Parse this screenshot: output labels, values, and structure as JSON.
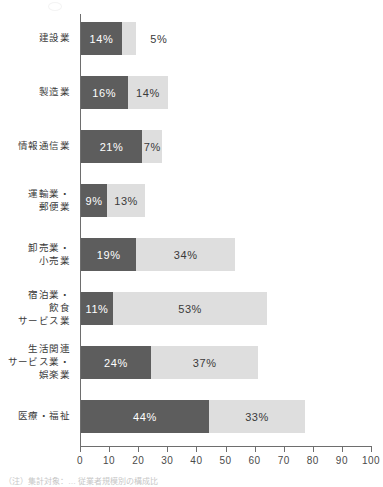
{
  "chart_data": {
    "type": "bar",
    "orientation": "horizontal",
    "stacked": true,
    "title": "",
    "subtitle": "",
    "xlabel": "",
    "ylabel": "",
    "xlim": [
      0,
      100
    ],
    "xticks": [
      "0",
      "10",
      "20",
      "30",
      "40",
      "50",
      "60",
      "70",
      "80",
      "90",
      "100"
    ],
    "grid": false,
    "legend_position": "none",
    "categories": [
      "建設業",
      "製造業",
      "情報通信業",
      "運輸業・\n郵便業",
      "卸売業・\n小売業",
      "宿泊業・\n飲食\nサービス業",
      "生活関連\nサービス業・\n娯楽業",
      "医療・福祉"
    ],
    "series": [
      {
        "name": "series-dark",
        "color": "#5d5d5d",
        "values": [
          14,
          16,
          21,
          9,
          19,
          11,
          24,
          44
        ],
        "labels": [
          "14%",
          "16%",
          "21%",
          "9%",
          "19%",
          "11%",
          "24%",
          "44%"
        ]
      },
      {
        "name": "series-light",
        "color": "#dedede",
        "values": [
          5,
          14,
          7,
          13,
          34,
          53,
          37,
          33
        ],
        "labels": [
          "5%",
          "14%",
          "7%",
          "13%",
          "34%",
          "53%",
          "37%",
          "33%"
        ],
        "label_outside": [
          true,
          false,
          false,
          false,
          false,
          false,
          false,
          false
        ]
      }
    ]
  },
  "caption": {
    "line": "（注）集計対象：… 従業者規模別の構成比"
  }
}
